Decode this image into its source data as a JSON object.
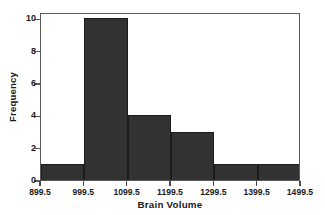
{
  "chart_data": {
    "type": "bar",
    "title": "",
    "subtitle": "",
    "xlabel": "Brain Volume",
    "ylabel": "Frequency",
    "categories": [
      "899.5-999.5",
      "999.5-1099.5",
      "1099.5-1199.5",
      "1199.5-1299.5",
      "1299.5-1399.5",
      "1399.5-1499.5"
    ],
    "bin_edges": [
      899.5,
      999.5,
      1099.5,
      1199.5,
      1299.5,
      1399.5,
      1499.5
    ],
    "values": [
      1,
      10,
      4,
      3,
      1,
      1
    ],
    "x": [
      899.5,
      999.5,
      1099.5,
      1199.5,
      1299.5,
      1399.5,
      1499.5
    ],
    "xlim": [
      899.5,
      1499.5
    ],
    "ylim": [
      0,
      10.4
    ],
    "xticks": [
      "899.5",
      "999.5",
      "1099.5",
      "1199.5",
      "1299.5",
      "1399.5",
      "1499.5"
    ],
    "xtick_values": [
      899.5,
      999.5,
      1099.5,
      1199.5,
      1299.5,
      1399.5,
      1499.5
    ],
    "yticks": [
      "0",
      "2",
      "4",
      "6",
      "8",
      "10"
    ],
    "ytick_values": [
      0,
      2,
      4,
      6,
      8,
      10
    ],
    "grid": false,
    "legend": false,
    "legend_position": "none",
    "bar_color": "#323232",
    "bar_edge_color": "#1c1c1c",
    "frame_color": "#5a5a5a",
    "background_color": "#ffffff",
    "text_color": "#1a1a1a"
  }
}
